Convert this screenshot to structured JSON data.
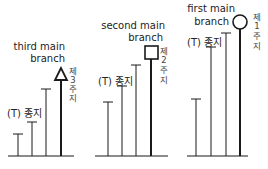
{
  "diagrams": [
    {
      "id": "third",
      "title_line1": "third main",
      "title_line2": "branch",
      "terminal_label": "(T) 종지",
      "vertical_label": [
        "제",
        "3",
        "주",
        "지"
      ],
      "marker": "triangle"
    },
    {
      "id": "second",
      "title_line1": "second main",
      "title_line2": "branch",
      "terminal_label": "(T) 종지",
      "vertical_label": [
        "제",
        "2",
        "주",
        "지"
      ],
      "marker": "square"
    },
    {
      "id": "first",
      "title_line1": "first main",
      "title_line2": "branch",
      "terminal_label": "(T) 종지",
      "vertical_label": [
        "제",
        "1",
        "주",
        "지"
      ],
      "marker": "circle"
    }
  ],
  "colors": {
    "line": "#1a1a1a",
    "text": "#222222"
  }
}
